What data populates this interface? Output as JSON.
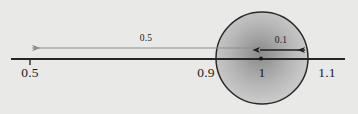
{
  "figure": {
    "background_color": "#e9e9e7",
    "axis_color": "#262626",
    "circle_outline_color": "#2a2a2a",
    "long_arrow_color": "#8d8d8d",
    "short_arrow_color": "#1f1f1f"
  },
  "axis": {
    "start_x": 11,
    "end_x": 345,
    "y": 59,
    "tick_labels": [
      {
        "text": "0.5",
        "x": 30,
        "y": 65,
        "has_tick_mark": true
      },
      {
        "text": "0.9",
        "x": 205,
        "y": 65,
        "has_tick_mark": false
      },
      {
        "text": "1",
        "x": 262,
        "y": 65,
        "has_tick_mark": false
      },
      {
        "text": "1.1",
        "x": 326,
        "y": 65,
        "has_tick_mark": false
      }
    ]
  },
  "circle": {
    "center_x": 262,
    "center_y": 58,
    "radius": 46,
    "center_dot_radius": 1.8,
    "gradient_stops": [
      {
        "offset": "0%",
        "color": "#8f8f8f"
      },
      {
        "offset": "18%",
        "color": "#999999"
      },
      {
        "offset": "38%",
        "color": "#a8a8a8"
      },
      {
        "offset": "62%",
        "color": "#bbbbbb"
      },
      {
        "offset": "85%",
        "color": "#c9c9c9"
      },
      {
        "offset": "100%",
        "color": "#d2d2d2"
      }
    ]
  },
  "arrows": {
    "long": {
      "label": "0.5",
      "label_x": 146,
      "label_y": 34,
      "from_x": 262,
      "to_x": 30,
      "y": 48,
      "double_headed": false
    },
    "short": {
      "label": "0.1",
      "label_x": 281,
      "label_y": 36,
      "from_x": 259,
      "to_x": 306,
      "y": 50,
      "double_headed": true
    }
  }
}
